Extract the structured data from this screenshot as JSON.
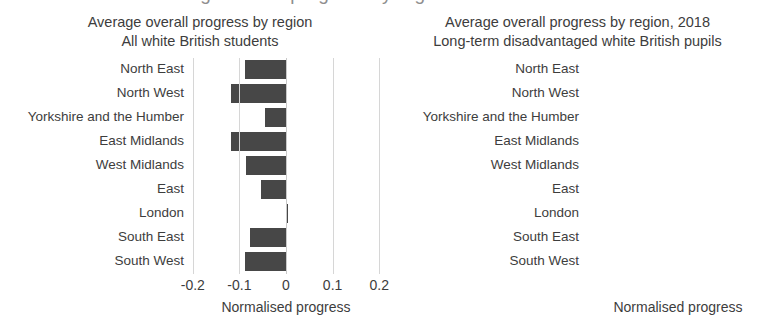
{
  "figure": {
    "cut_off_top_text": "Average overall progress by region",
    "bar_color": "#474747",
    "grid_color": "#d6d6d6",
    "text_color": "#3d3d3d"
  },
  "chart_data": [
    {
      "id": "left",
      "type": "bar",
      "orientation": "horizontal",
      "title": "Average overall progress by region",
      "subtitle": "All white British students",
      "xlabel": "Normalised progress",
      "ylabel": "",
      "xlim": [
        -0.2,
        0.2
      ],
      "xticks": [
        -0.2,
        -0.1,
        0,
        0.1,
        0.2
      ],
      "xticklabels": [
        "-0.2",
        "-0.1",
        "0",
        "0.1",
        "0.2"
      ],
      "grid": true,
      "legend": false,
      "categories": [
        "North East",
        "North West",
        "Yorkshire and the Humber",
        "East Midlands",
        "West Midlands",
        "East",
        "London",
        "South East",
        "South West"
      ],
      "values": [
        -0.088,
        -0.117,
        -0.045,
        -0.117,
        -0.085,
        -0.054,
        0.002,
        -0.078,
        -0.087
      ]
    },
    {
      "id": "right",
      "type": "bar",
      "orientation": "horizontal",
      "title": "Average overall progress by region, 2018",
      "subtitle": "Long-term disadvantaged white British pupils",
      "xlabel": "Normalised progress",
      "ylabel": "",
      "xlim": [
        -0.6,
        0.6
      ],
      "xticks": [
        -0.6,
        -0.3,
        0,
        0.3,
        0.6
      ],
      "xticklabels": [
        "-0.6",
        "-0.3",
        "0",
        "0.3",
        "0"
      ],
      "grid": true,
      "legend": false,
      "categories": [
        "North East",
        "North West",
        "Yorkshire and the Humber",
        "East Midlands",
        "West Midlands",
        "East",
        "London",
        "South East",
        "South West"
      ],
      "values": [
        -0.38,
        -0.45,
        -0.33,
        -0.42,
        -0.4,
        -0.36,
        -0.43,
        -0.44,
        -0.41
      ]
    }
  ]
}
